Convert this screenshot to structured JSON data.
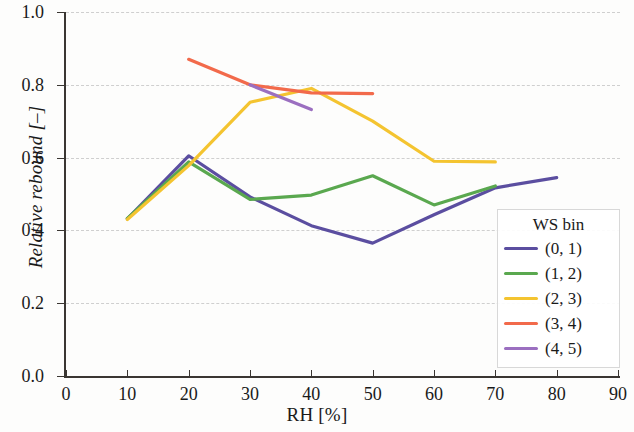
{
  "chart_data": {
    "type": "line",
    "title": "",
    "xlabel": "RH [%]",
    "ylabel": "Relative rebound [–]",
    "xlim": [
      0,
      90
    ],
    "ylim": [
      0.0,
      1.0
    ],
    "xticks": [
      0,
      10,
      20,
      30,
      40,
      50,
      60,
      70,
      80,
      90
    ],
    "xtick_labels": [
      "0",
      "10",
      "20",
      "30",
      "40",
      "50",
      "60",
      "70",
      "80",
      "90"
    ],
    "yticks": [
      0.0,
      0.2,
      0.4,
      0.6,
      0.8,
      1.0
    ],
    "ytick_labels": [
      "0.0",
      "0.2",
      "0.4",
      "0.6",
      "0.8",
      "1.0"
    ],
    "grid": "horizontal-dashed",
    "legend_position": "lower-right-inside",
    "legend_title": "WS bin",
    "series": [
      {
        "name": "(0, 1)",
        "color": "#5b4ea0",
        "x": [
          10,
          20,
          30,
          40,
          50,
          60,
          70,
          80
        ],
        "y": [
          0.432,
          0.605,
          0.492,
          0.413,
          0.365,
          0.443,
          0.517,
          0.545
        ]
      },
      {
        "name": "(1, 2)",
        "color": "#5aa84f",
        "x": [
          10,
          20,
          30,
          40,
          50,
          60,
          70
        ],
        "y": [
          0.433,
          0.588,
          0.485,
          0.497,
          0.55,
          0.47,
          0.522
        ]
      },
      {
        "name": "(2, 3)",
        "color": "#f4c430",
        "x": [
          10,
          20,
          30,
          40,
          50,
          60,
          70
        ],
        "y": [
          0.43,
          0.578,
          0.752,
          0.79,
          0.7,
          0.59,
          0.588
        ]
      },
      {
        "name": "(3, 4)",
        "color": "#f26a4b",
        "x": [
          20,
          30,
          40,
          50
        ],
        "y": [
          0.87,
          0.8,
          0.778,
          0.776
        ]
      },
      {
        "name": "(4, 5)",
        "color": "#9b6fc0",
        "x": [
          30,
          40
        ],
        "y": [
          0.8,
          0.732
        ]
      }
    ]
  },
  "legend": {
    "title": "WS bin",
    "items": [
      {
        "label": "(0, 1)",
        "color": "#5b4ea0"
      },
      {
        "label": "(1, 2)",
        "color": "#5aa84f"
      },
      {
        "label": "(2, 3)",
        "color": "#f4c430"
      },
      {
        "label": "(3, 4)",
        "color": "#f26a4b"
      },
      {
        "label": "(4, 5)",
        "color": "#9b6fc0"
      }
    ]
  }
}
